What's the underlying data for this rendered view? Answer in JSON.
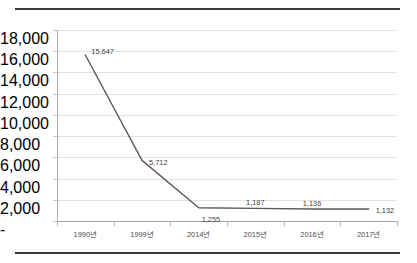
{
  "figure": {
    "background_color": "#ffffff",
    "rule_color": "#3b3b3b",
    "top_rule": "",
    "bottom_rule": ""
  },
  "chart_data": {
    "type": "line",
    "title": "",
    "xlabel": "",
    "ylabel": "",
    "categories": [
      "1990년",
      "1999년",
      "2014년",
      "2015년",
      "2016년",
      "2017년"
    ],
    "values": [
      15647,
      5712,
      1255,
      1187,
      1136,
      1132
    ],
    "data_labels": [
      "15,647",
      "5,712",
      "1,255",
      "1,187",
      "1,136",
      "1,132"
    ],
    "ylim": [
      0,
      18000
    ],
    "ytick_values": [
      0,
      2000,
      4000,
      6000,
      8000,
      10000,
      12000,
      14000,
      16000,
      18000
    ],
    "ytick_labels": [
      "-",
      "2,000",
      "4,000",
      "6,000",
      "8,000",
      "10,000",
      "12,000",
      "14,000",
      "16,000",
      "18,000"
    ],
    "grid": true,
    "grid_color": "#e2e2e2",
    "legend": false,
    "series_color": "#595959",
    "markers": false
  }
}
